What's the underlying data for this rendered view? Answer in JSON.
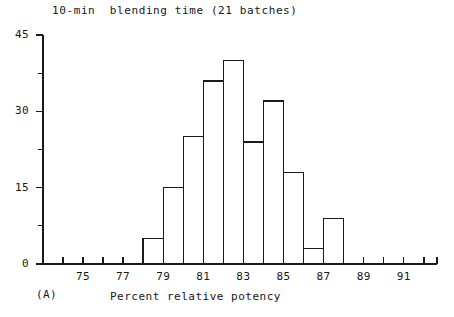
{
  "chart_data": {
    "type": "bar",
    "title": "10-min  blending time (21 batches)",
    "xlabel": "Percent relative potency",
    "ylabel": "",
    "panel_label": "(A)",
    "xlim": [
      73.6,
      92.6
    ],
    "ylim": [
      0,
      45
    ],
    "grid": false,
    "legend": null,
    "bin_width": 1,
    "categories": [
      "78-79",
      "79-80",
      "80-81",
      "81-82",
      "82-83",
      "83-84",
      "84-85",
      "85-86",
      "86-87",
      "87-88"
    ],
    "bin_starts": [
      78,
      79,
      80,
      81,
      82,
      83,
      84,
      85,
      86,
      87
    ],
    "values": [
      5,
      15,
      25,
      36,
      40,
      24,
      32,
      18,
      3,
      9
    ],
    "x_ticks": [
      75,
      77,
      79,
      81,
      83,
      85,
      87,
      89,
      91
    ],
    "x_tick_labels": [
      "75",
      "77",
      "79",
      "81",
      "83",
      "85",
      "87",
      "89",
      "91"
    ],
    "x_minor_ticks": [
      74,
      76,
      78,
      80,
      82,
      84,
      86,
      88,
      90,
      92
    ],
    "y_ticks": [
      0,
      15,
      30,
      45
    ],
    "y_tick_labels": [
      "0",
      "15",
      "30",
      "45"
    ],
    "y_minor_ticks": [
      7.5,
      22.5,
      37.5
    ],
    "colors": {
      "axis": "#1a1a1a",
      "bar_stroke": "#1a1a1a",
      "bar_fill": "#ffffff",
      "background": "#ffffff",
      "text": "#161616"
    }
  },
  "axis_labels": {
    "y": [
      "45",
      "30",
      "15",
      "0"
    ],
    "x": [
      "75",
      "77",
      "79",
      "81",
      "83",
      "85",
      "87",
      "89",
      "91"
    ]
  }
}
